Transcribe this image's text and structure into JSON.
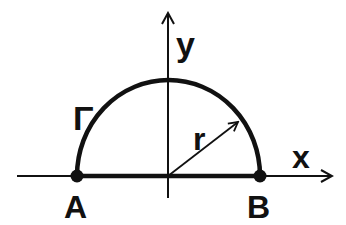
{
  "diagram": {
    "type": "semicircle-contour",
    "colors": {
      "stroke": "#111111",
      "background": "#ffffff"
    },
    "axes": {
      "x": {
        "label": "x",
        "from": [
          17,
          176
        ],
        "to": [
          332,
          176
        ]
      },
      "y": {
        "label": "y",
        "from": [
          168,
          198
        ],
        "to": [
          168,
          13
        ]
      }
    },
    "origin": [
      168,
      176
    ],
    "curve": {
      "label": "Γ",
      "shape": "upper semicircle",
      "center": [
        168,
        176
      ],
      "rx": 91.5,
      "ry": 96
    },
    "radius": {
      "label": "r",
      "from": [
        168,
        176
      ],
      "to": [
        238,
        122
      ]
    },
    "points": [
      {
        "id": "A",
        "label": "A",
        "x": 77,
        "y": 176
      },
      {
        "id": "B",
        "label": "B",
        "x": 260,
        "y": 176
      }
    ],
    "labels": {
      "x_axis": "x",
      "y_axis": "y",
      "curve": "Γ",
      "radius": "r",
      "point_a": "A",
      "point_b": "B"
    }
  }
}
